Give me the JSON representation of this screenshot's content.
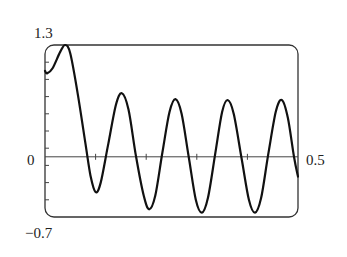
{
  "chart_data": {
    "type": "line",
    "title": "",
    "xlabel": "",
    "ylabel": "",
    "xlim": [
      0,
      0.5
    ],
    "ylim": [
      -0.7,
      1.3
    ],
    "x_tick_spacing": 0.1,
    "y_tick_spacing": 0.2,
    "grid": false,
    "legend": null,
    "labels": {
      "y_max": "1.3",
      "y_min": "−0.7",
      "origin": "0",
      "x_max": "0.5"
    },
    "series": [
      {
        "name": "f(x)",
        "x": [
          0,
          0.004,
          0.015,
          0.03,
          0.04,
          0.05,
          0.065,
          0.08,
          0.09,
          0.1,
          0.11,
          0.125,
          0.14,
          0.152,
          0.165,
          0.18,
          0.195,
          0.206,
          0.218,
          0.232,
          0.246,
          0.258,
          0.27,
          0.284,
          0.298,
          0.31,
          0.322,
          0.336,
          0.35,
          0.361,
          0.373,
          0.388,
          0.403,
          0.415,
          0.427,
          0.441,
          0.456,
          0.468,
          0.48,
          0.492,
          0.5
        ],
        "y": [
          1.0,
          0.97,
          1.03,
          1.22,
          1.3,
          1.2,
          0.72,
          0.15,
          -0.22,
          -0.41,
          -0.3,
          0.15,
          0.6,
          0.74,
          0.55,
          0.0,
          -0.45,
          -0.61,
          -0.45,
          0.05,
          0.52,
          0.67,
          0.5,
          0.0,
          -0.5,
          -0.65,
          -0.48,
          0.02,
          0.52,
          0.66,
          0.5,
          0.0,
          -0.5,
          -0.65,
          -0.48,
          0.02,
          0.52,
          0.66,
          0.45,
          0.0,
          -0.23
        ]
      }
    ]
  }
}
